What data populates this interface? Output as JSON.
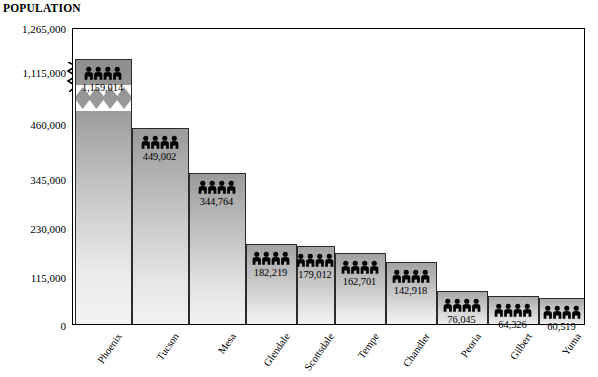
{
  "axis": {
    "y_title": "POPULATION",
    "y_ticks": [
      "1,265,000",
      "1,115,000",
      "460,000",
      "345,000",
      "230,000",
      "115,000",
      "0"
    ]
  },
  "callout": {
    "line1": "TOTAL POPULATION:",
    "line2": "4,526,000   (2000 estimate)"
  },
  "icons": {
    "people": "people-group-icon"
  },
  "chart_data": {
    "type": "bar",
    "title": "POPULATION",
    "xlabel": "",
    "ylabel": "POPULATION",
    "ylim": [
      0,
      1265000
    ],
    "grid": false,
    "legend": "none",
    "axis_break": {
      "present": true,
      "lower": 460000,
      "upper": 1115000,
      "note": "y-axis is broken between 460,000 and 1,115,000"
    },
    "y_tick_values": [
      1265000,
      1115000,
      460000,
      345000,
      230000,
      115000,
      0
    ],
    "y_tick_labels": [
      "1,265,000",
      "1,115,000",
      "460,000",
      "345,000",
      "230,000",
      "115,000",
      "0"
    ],
    "categories": [
      "Phoenix",
      "Tucson",
      "Mesa",
      "Glendale",
      "Scottsdale",
      "Tempe",
      "Chandler",
      "Peoria",
      "Gilbert",
      "Yuma"
    ],
    "values": [
      1159014,
      449002,
      344764,
      182219,
      179012,
      162701,
      142918,
      76045,
      64326,
      60519
    ],
    "value_labels": [
      "1,159,014",
      "449,002",
      "344,764",
      "182,219",
      "179,012",
      "162,701",
      "142,918",
      "76,045",
      "64,326",
      "60,519"
    ],
    "total": 4526000,
    "total_label": "4,526,000",
    "estimate_year": "2000"
  }
}
